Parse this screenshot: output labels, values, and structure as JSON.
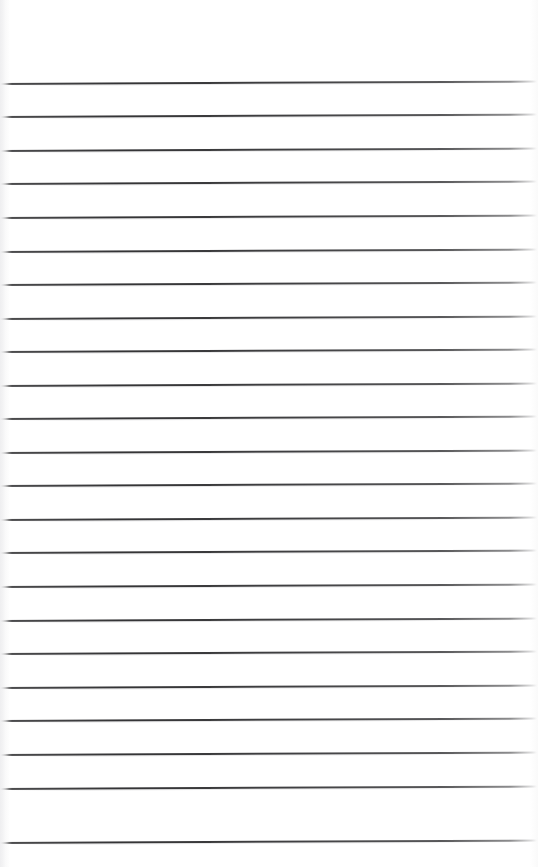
{
  "document": {
    "kind": "scanned-ruled-paper",
    "title": "Blank Ruled Notebook Page",
    "page_width": 538,
    "page_height": 867,
    "background_color": "#ffffff",
    "content_text": "",
    "has_handwriting": false,
    "has_printed_text": false
  },
  "ruling": {
    "line_color": "#343436",
    "line_count": 23,
    "line_spacing": 33.5,
    "first_line_y": 83,
    "last_line_y": 842,
    "line_thickness": 1.5,
    "line_start_x": 0,
    "line_end_x": 537,
    "skew_degrees": -0.26,
    "lines": [
      {
        "index": 1,
        "y": 83
      },
      {
        "index": 2,
        "y": 116
      },
      {
        "index": 3,
        "y": 150
      },
      {
        "index": 4,
        "y": 183
      },
      {
        "index": 5,
        "y": 217
      },
      {
        "index": 6,
        "y": 251
      },
      {
        "index": 7,
        "y": 284
      },
      {
        "index": 8,
        "y": 318
      },
      {
        "index": 9,
        "y": 351
      },
      {
        "index": 10,
        "y": 385
      },
      {
        "index": 11,
        "y": 418
      },
      {
        "index": 12,
        "y": 452
      },
      {
        "index": 13,
        "y": 485
      },
      {
        "index": 14,
        "y": 519
      },
      {
        "index": 15,
        "y": 552
      },
      {
        "index": 16,
        "y": 586
      },
      {
        "index": 17,
        "y": 620
      },
      {
        "index": 18,
        "y": 653
      },
      {
        "index": 19,
        "y": 687
      },
      {
        "index": 20,
        "y": 720
      },
      {
        "index": 21,
        "y": 754
      },
      {
        "index": 22,
        "y": 788
      },
      {
        "index": 23,
        "y": 842
      }
    ]
  },
  "margins": {
    "top_margin_height": 83,
    "bottom_margin_height": 25,
    "left_edge_artifact_width": 9
  }
}
